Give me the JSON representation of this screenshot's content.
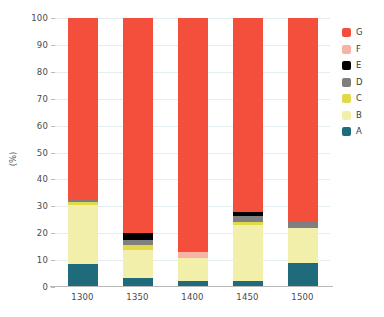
{
  "chart_data": {
    "type": "bar",
    "subtype": "stacked-bar-100",
    "title": "",
    "xlabel": "",
    "ylabel": "(%)",
    "ylim": [
      0,
      100
    ],
    "ytick_labels": [
      "0",
      "10",
      "20",
      "30",
      "40",
      "50",
      "60",
      "70",
      "80",
      "90",
      "100"
    ],
    "yticks": [
      0,
      10,
      20,
      30,
      40,
      50,
      60,
      70,
      80,
      90,
      100
    ],
    "grid": true,
    "legend_position": "right",
    "categories": [
      "1300",
      "1350",
      "1400",
      "1450",
      "1500"
    ],
    "series": [
      {
        "name": "A",
        "color": "#1f6b7b",
        "values": [
          8.5,
          3.3,
          2.2,
          2.2,
          8.9
        ]
      },
      {
        "name": "B",
        "color": "#f2efaa",
        "values": [
          22.0,
          10.5,
          8.6,
          20.8,
          13.0
        ]
      },
      {
        "name": "C",
        "color": "#e0d94a",
        "values": [
          1.2,
          2.0,
          0.0,
          1.2,
          0.0
        ]
      },
      {
        "name": "D",
        "color": "#7f7f7f",
        "values": [
          1.0,
          1.8,
          0.0,
          2.2,
          2.2
        ]
      },
      {
        "name": "E",
        "color": "#000000",
        "values": [
          0.0,
          2.6,
          0.0,
          1.5,
          0.0
        ]
      },
      {
        "name": "F",
        "color": "#f6b3a6",
        "values": [
          0.0,
          0.0,
          2.2,
          0.0,
          0.0
        ]
      },
      {
        "name": "G",
        "color": "#f44f3c",
        "values": [
          67.3,
          79.8,
          87.0,
          72.1,
          75.9
        ]
      }
    ],
    "legend_entries": [
      {
        "label": "G",
        "color": "#f44f3c"
      },
      {
        "label": "F",
        "color": "#f6b3a6"
      },
      {
        "label": "E",
        "color": "#000000"
      },
      {
        "label": "D",
        "color": "#7f7f7f"
      },
      {
        "label": "C",
        "color": "#e0d94a"
      },
      {
        "label": "B",
        "color": "#f2efaa"
      },
      {
        "label": "A",
        "color": "#1f6b7b"
      }
    ]
  }
}
